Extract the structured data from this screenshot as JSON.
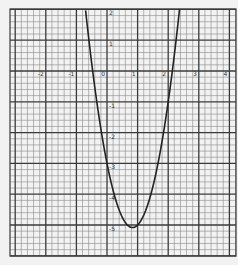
{
  "chart_data": {
    "type": "line",
    "title": "",
    "xlabel": "",
    "ylabel": "",
    "function": "y = 3x^2 - 5x - 3",
    "coefficients": {
      "a": 3,
      "b": -5,
      "c": -3
    },
    "xlim": [
      -3.1,
      4.2
    ],
    "ylim": [
      -6,
      2
    ],
    "grid": true,
    "minor_per_unit": 5,
    "x_ticks": [
      -2,
      -1,
      0,
      1,
      2,
      3,
      4
    ],
    "x_tick_labels": [
      "-2",
      "-1",
      "0",
      "1",
      "2",
      "3",
      "4"
    ],
    "y_ticks": [
      2,
      1,
      -1,
      -2,
      -3,
      -4,
      -5
    ],
    "y_tick_labels": [
      "2",
      "1",
      "-1",
      "-2",
      "-3",
      "-4",
      "-5"
    ],
    "vertex": [
      0.83,
      -5.08
    ],
    "roots": [
      -0.47,
      2.13
    ],
    "series": [
      {
        "name": "parabola",
        "color": "#222222"
      }
    ]
  },
  "colors": {
    "background": "#f2f2f2",
    "minor_grid": "#8a8a8a",
    "major_grid": "#3a3a3a",
    "curve": "#222222"
  }
}
